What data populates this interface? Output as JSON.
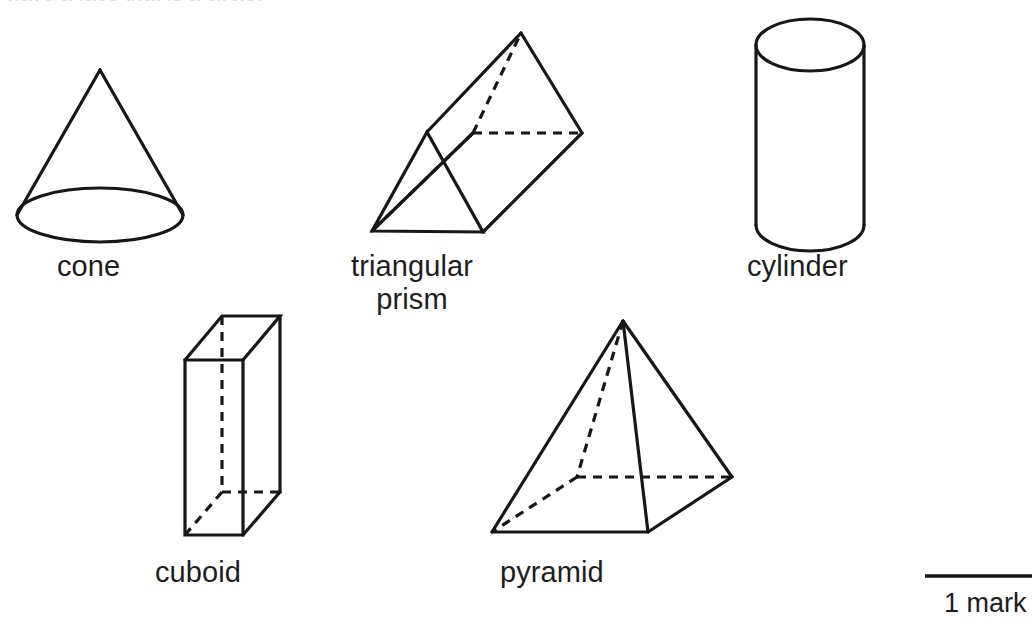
{
  "page": {
    "width": 1032,
    "height": 639,
    "background_color": "#ffffff",
    "ink_color": "#171717",
    "truncated_heading": "have a face that is a circle."
  },
  "shapes": [
    {
      "id": "cone",
      "label": "cone",
      "kind": "cone",
      "has_hidden_edges": false
    },
    {
      "id": "triangular-prism",
      "label": "triangular",
      "label_line2": "prism",
      "kind": "triangular-prism",
      "has_hidden_edges": true
    },
    {
      "id": "cylinder",
      "label": "cylinder",
      "kind": "cylinder",
      "has_hidden_edges": false
    },
    {
      "id": "cuboid",
      "label": "cuboid",
      "kind": "cuboid",
      "has_hidden_edges": true
    },
    {
      "id": "pyramid",
      "label": "pyramid",
      "kind": "square-pyramid",
      "has_hidden_edges": true
    }
  ],
  "marks": {
    "value": "1 mark"
  }
}
